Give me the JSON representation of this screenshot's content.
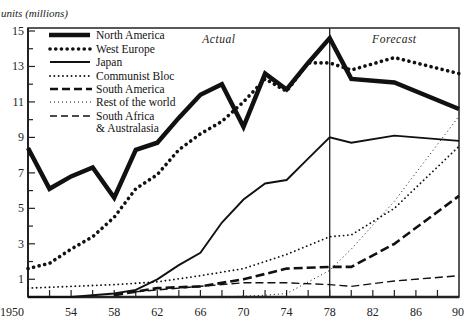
{
  "chart_data": {
    "type": "line",
    "title": "",
    "ylabel": "units (millions)",
    "xlabel": "",
    "xlim": [
      1950,
      1990
    ],
    "ylim": [
      0,
      15
    ],
    "x_ticks": [
      "1950",
      "54",
      "58",
      "62",
      "66",
      "70",
      "74",
      "78",
      "82",
      "86",
      "90"
    ],
    "y_ticks": [
      "1",
      "3",
      "5",
      "7",
      "9",
      "11",
      "13",
      "15"
    ],
    "grid": false,
    "legend_position": "upper-left",
    "annotations": [
      {
        "text": "Actual",
        "x_range": [
          1950,
          1978
        ]
      },
      {
        "text": "Forecast",
        "x_range": [
          1978,
          1990
        ]
      }
    ],
    "divider_year": 1978,
    "series": [
      {
        "name": "North America",
        "style": "thick-solid",
        "x": [
          1950,
          1952,
          1954,
          1956,
          1958,
          1960,
          1962,
          1964,
          1966,
          1968,
          1970,
          1972,
          1974,
          1976,
          1978,
          1980,
          1984,
          1990
        ],
        "values": [
          8.4,
          6.1,
          6.8,
          7.3,
          5.6,
          8.3,
          8.7,
          10.1,
          11.4,
          12.0,
          9.6,
          12.6,
          11.7,
          13.2,
          14.6,
          12.3,
          12.1,
          10.6
        ]
      },
      {
        "name": "West Europe",
        "style": "heavy-dotted",
        "x": [
          1950,
          1952,
          1954,
          1956,
          1958,
          1960,
          1962,
          1964,
          1966,
          1968,
          1970,
          1972,
          1974,
          1976,
          1978,
          1980,
          1984,
          1990
        ],
        "values": [
          1.6,
          1.9,
          2.7,
          3.4,
          4.5,
          6.1,
          6.9,
          8.3,
          9.2,
          9.9,
          11.0,
          12.3,
          11.6,
          13.2,
          13.2,
          12.8,
          13.5,
          12.6
        ]
      },
      {
        "name": "Japan",
        "style": "solid",
        "x": [
          1950,
          1954,
          1958,
          1960,
          1962,
          1964,
          1966,
          1968,
          1970,
          1972,
          1974,
          1976,
          1978,
          1980,
          1984,
          1990
        ],
        "values": [
          0.0,
          0.0,
          0.2,
          0.4,
          1.0,
          1.8,
          2.5,
          4.2,
          5.5,
          6.4,
          6.6,
          7.8,
          9.0,
          8.7,
          9.1,
          8.8
        ]
      },
      {
        "name": "Communist Bloc",
        "style": "dotted",
        "x": [
          1950,
          1954,
          1958,
          1962,
          1966,
          1970,
          1974,
          1978,
          1980,
          1984,
          1990
        ],
        "values": [
          0.5,
          0.6,
          0.7,
          0.85,
          1.2,
          1.6,
          2.4,
          3.4,
          3.5,
          5.0,
          8.5
        ]
      },
      {
        "name": "South America",
        "style": "heavy-dashed",
        "x": [
          1958,
          1962,
          1966,
          1970,
          1974,
          1978,
          1980,
          1984,
          1990
        ],
        "values": [
          0.1,
          0.5,
          0.6,
          1.0,
          1.6,
          1.7,
          1.7,
          3.0,
          5.7
        ]
      },
      {
        "name": "Rest of the world",
        "style": "fine-dotted",
        "x": [
          1968,
          1972,
          1974,
          1978,
          1980,
          1984,
          1990
        ],
        "values": [
          0.0,
          0.1,
          0.2,
          1.5,
          2.7,
          5.4,
          10.2
        ]
      },
      {
        "name": "South Africa & Australasia",
        "style": "light-dashed",
        "x": [
          1960,
          1964,
          1970,
          1974,
          1978,
          1980,
          1984,
          1990
        ],
        "values": [
          0.3,
          0.5,
          0.8,
          0.8,
          0.7,
          0.6,
          0.9,
          1.2
        ]
      }
    ]
  },
  "legend": {
    "items": [
      {
        "label": "North America"
      },
      {
        "label": "West Europe"
      },
      {
        "label": "Japan"
      },
      {
        "label": "Communist Bloc"
      },
      {
        "label": "South America"
      },
      {
        "label": "Rest of the world"
      },
      {
        "label": "South Africa"
      },
      {
        "label": "& Australasia"
      }
    ]
  }
}
